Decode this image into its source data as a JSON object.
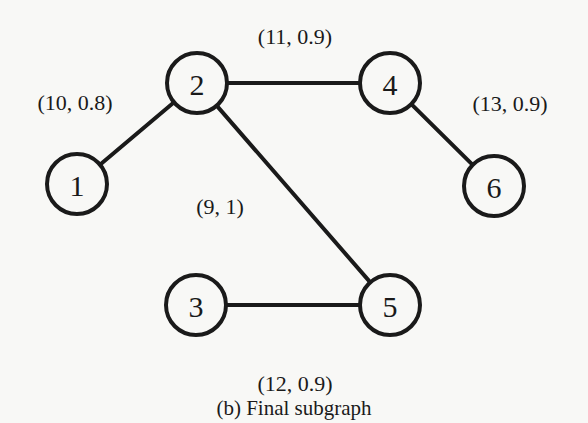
{
  "figure": {
    "caption": "(b) Final subgraph",
    "colors": {
      "stroke": "#1a1a1a",
      "background": "#f8f8f6"
    },
    "nodes": [
      {
        "id": "1",
        "label": "1",
        "x": 77,
        "y": 184
      },
      {
        "id": "2",
        "label": "2",
        "x": 197,
        "y": 83
      },
      {
        "id": "3",
        "label": "3",
        "x": 196,
        "y": 305
      },
      {
        "id": "4",
        "label": "4",
        "x": 390,
        "y": 83
      },
      {
        "id": "5",
        "label": "5",
        "x": 390,
        "y": 305
      },
      {
        "id": "6",
        "label": "6",
        "x": 494,
        "y": 186
      }
    ],
    "edges": [
      {
        "from": "1",
        "to": "2",
        "label": "(10, 0.8)",
        "label_x": 75,
        "label_y": 102
      },
      {
        "from": "2",
        "to": "4",
        "label": "(11, 0.9)",
        "label_x": 295,
        "label_y": 36
      },
      {
        "from": "2",
        "to": "5",
        "label": "(9, 1)",
        "label_x": 220,
        "label_y": 206
      },
      {
        "from": "4",
        "to": "6",
        "label": "(13, 0.9)",
        "label_x": 510,
        "label_y": 103
      },
      {
        "from": "3",
        "to": "5",
        "label": "(12, 0.9)",
        "label_x": 295,
        "label_y": 383
      }
    ]
  }
}
